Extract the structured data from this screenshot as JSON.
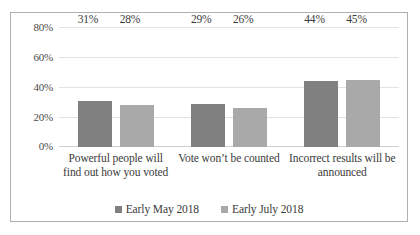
{
  "chart_data": {
    "type": "bar",
    "title": "",
    "subtitle": "",
    "xlabel": "",
    "ylabel": "",
    "ylim": [
      0,
      80
    ],
    "ytick_labels": [
      "80%",
      "60%",
      "40%",
      "20%",
      "0%"
    ],
    "ytick_values": [
      80,
      60,
      40,
      20,
      0
    ],
    "grid": true,
    "legend_position": "bottom",
    "categories": [
      "Powerful people will find out how you voted",
      "Vote won’t be counted",
      "Incorrect results will be announced"
    ],
    "series": [
      {
        "name": "Early May 2018",
        "color": "#808080",
        "values": [
          31,
          29,
          44
        ],
        "value_labels": [
          "31%",
          "29%",
          "44%"
        ]
      },
      {
        "name": "Early July 2018",
        "color": "#a9a9a9",
        "values": [
          28,
          26,
          45
        ],
        "value_labels": [
          "28%",
          "26%",
          "45%"
        ]
      }
    ]
  },
  "legend": {
    "items": [
      {
        "label": "Early May 2018",
        "marker": "square-marker-icon"
      },
      {
        "label": "Early July 2018",
        "marker": "square-marker-icon"
      }
    ]
  },
  "colors": {
    "series_1": "#808080",
    "series_2": "#a9a9a9",
    "gridline": "#e2e2e2",
    "border": "#b0b0b0",
    "text": "#3a3a3a"
  }
}
